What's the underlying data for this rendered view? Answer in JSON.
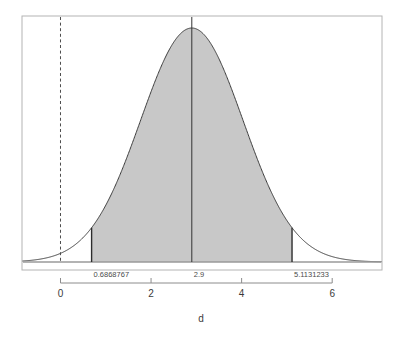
{
  "chart_data": {
    "type": "area",
    "title": "",
    "xlabel": "d",
    "ylabel": "",
    "distribution": "normal",
    "mean": 2.9,
    "sd": 1.129,
    "xlim": [
      -0.85,
      7.1
    ],
    "ylim": [
      0,
      0.3534
    ],
    "grid": false,
    "legend": false,
    "x_ticks": [
      0,
      2,
      4,
      6
    ],
    "x_tick_labels": [
      "0",
      "2",
      "4",
      "6"
    ],
    "shaded_region": {
      "from": 0.6868767,
      "to": 5.1131233,
      "fill_color": "#c8c8c8",
      "label_left": "0.6868767",
      "label_right": "5.1131233"
    },
    "center_line": {
      "value": 2.9,
      "label": "2.9",
      "style": "solid",
      "color": "#333333"
    },
    "reference_line": {
      "value": 0,
      "label": "",
      "style": "dashed",
      "color": "#4d4d4d"
    },
    "curve_color": "#3c3c3c",
    "box_color": "#b4b4b4",
    "axis_color": "#8c8c8c",
    "baseline_color": "#9a9a9a"
  },
  "axis": {
    "title": "d",
    "ticks": [
      {
        "label": "0"
      },
      {
        "label": "2"
      },
      {
        "label": "4"
      },
      {
        "label": "6"
      }
    ]
  },
  "annotations": {
    "lower_bound": "0.6868767",
    "center": "2.9",
    "upper_bound": "5.1131233"
  }
}
